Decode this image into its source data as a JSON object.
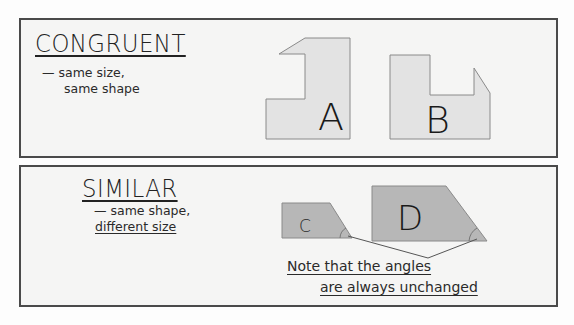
{
  "congruent": {
    "title": "CONGRUENT",
    "description_line1": "— same size,",
    "description_line2": "same shape",
    "shapes": [
      {
        "label": "A",
        "points": "305,38 350,38 350,139 266,139 266,99 305,99 305,54 279,54"
      },
      {
        "label": "B",
        "points": "390,55 430,55 430,95 474,95 474,68 490,93 490,139 390,139"
      }
    ],
    "fill": "#e3e3e3"
  },
  "similar": {
    "title": "SIMILAR",
    "description_line1": "— same shape,",
    "description_line2": "different size",
    "shapes": [
      {
        "label": "C",
        "points": "282,203 330,203 352,238 282,238"
      },
      {
        "label": "D",
        "points": "372,186 446,186 487,241 372,241"
      }
    ],
    "fill": "#b7b7b7",
    "note_line1": "Note that the angles",
    "note_line2": "are always unchanged"
  }
}
